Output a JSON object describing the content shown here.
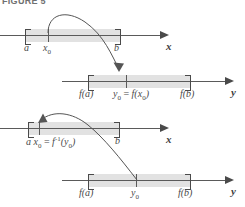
{
  "figure": {
    "caption": "FIGURE 5"
  },
  "lines": [
    {
      "id": "line-1-x",
      "axis_label": "x",
      "endpoints": [
        "a",
        "b"
      ],
      "tick_label": "x",
      "tick_sub": "0",
      "labels": [
        {
          "text": "a",
          "sub": ""
        },
        {
          "text": "x",
          "sub": "0"
        },
        {
          "text": "b",
          "sub": ""
        }
      ]
    },
    {
      "id": "line-2-y",
      "axis_label": "y",
      "labels": [
        {
          "text": "f(a)"
        },
        {
          "text": "y",
          "sub": "0",
          "eq": " = ",
          "tail": "f(x",
          "tail_sub": "0",
          "tail_end": ")"
        },
        {
          "text": "f(b)"
        }
      ]
    },
    {
      "id": "line-3-x",
      "axis_label": "x",
      "labels": [
        {
          "text": "a"
        },
        {
          "text": "x",
          "sub": "0",
          "eq": " = ",
          "inv": "f",
          "sup": "-1",
          "tail": "(y",
          "tail_sub": "0",
          "tail_end": ")"
        },
        {
          "text": "b"
        }
      ]
    },
    {
      "id": "line-4-y",
      "axis_label": "y",
      "labels": [
        {
          "text": "f(a)"
        },
        {
          "text": "y",
          "sub": "0"
        },
        {
          "text": "f(b)"
        }
      ]
    }
  ],
  "text": {
    "a": "a",
    "b": "b",
    "x": "x",
    "y": "y",
    "zero": "0",
    "f_of_a": "f(a)",
    "f_of_b": "f(b)",
    "equals": "=",
    "f_open": "f(",
    "close_paren": ")",
    "f_inv": "f",
    "neg_one": "-1",
    "open_paren": "("
  },
  "colors": {
    "band": "#e2e2e2",
    "axis": "#5a5a5a",
    "bracket": "#4a4a4a",
    "label": "#4a4a4a",
    "caption": "#6f7070",
    "curve": "#555555",
    "background": "#ffffff"
  },
  "arrows": [
    {
      "name": "forward-map-arrow",
      "from": "x0 on line 1",
      "to": "y0 on line 2"
    },
    {
      "name": "inverse-map-arrow",
      "from": "y0 on line 4",
      "to": "x0 on line 3"
    }
  ]
}
